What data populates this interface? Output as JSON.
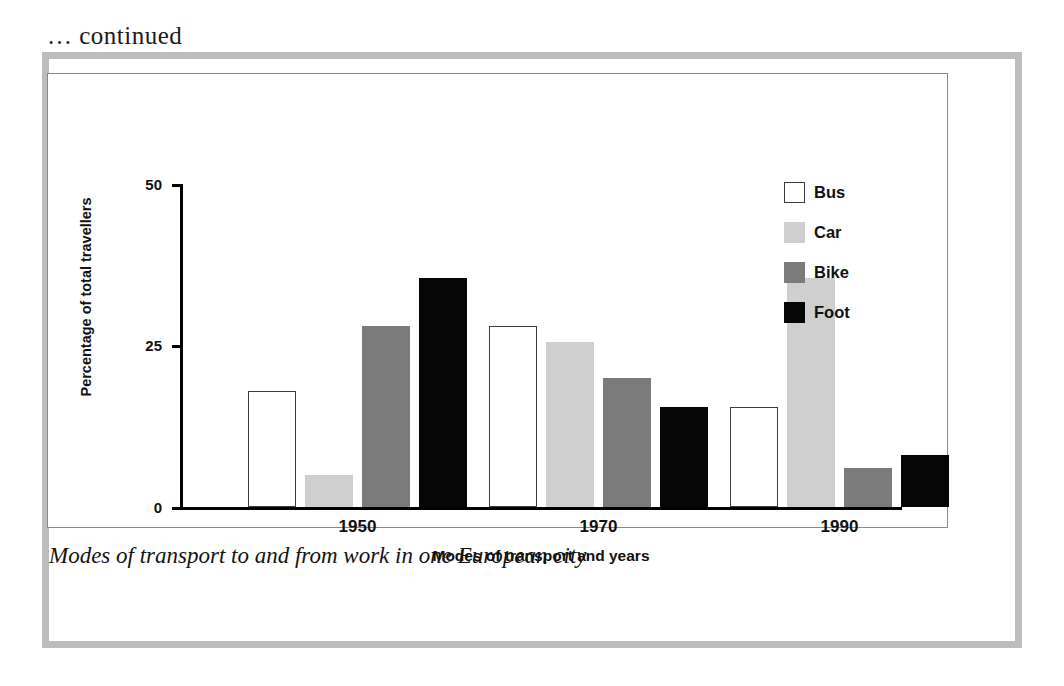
{
  "page": {
    "continued_note": "… continued",
    "caption": "Modes of transport to and from work in one European city"
  },
  "colors": {
    "bus": "#ffffff",
    "car": "#cfcfcf",
    "bike": "#7b7b7b",
    "foot": "#060606",
    "frame": "#bdbdbd",
    "axis": "#000000"
  },
  "legend": {
    "position": "top-right",
    "items": [
      {
        "label": "Bus",
        "key": "bus"
      },
      {
        "label": "Car",
        "key": "car"
      },
      {
        "label": "Bike",
        "key": "bike"
      },
      {
        "label": "Foot",
        "key": "foot"
      }
    ]
  },
  "chart_data": {
    "type": "bar",
    "title": "",
    "xlabel": "Modes of transport and years",
    "ylabel": "Percentage of total travellers",
    "categories": [
      "1950",
      "1970",
      "1990"
    ],
    "series": [
      {
        "name": "Bus",
        "values": [
          18,
          28,
          15.5
        ]
      },
      {
        "name": "Car",
        "values": [
          5,
          25.5,
          35.5
        ]
      },
      {
        "name": "Bike",
        "values": [
          28,
          20,
          6
        ]
      },
      {
        "name": "Foot",
        "values": [
          35.5,
          15.5,
          8
        ]
      }
    ],
    "ylim": [
      0,
      50
    ],
    "yticks": [
      0,
      25,
      50
    ],
    "ytick_labels": [
      "0",
      "25",
      "50"
    ],
    "grid": false,
    "legend_position": "top-right"
  }
}
